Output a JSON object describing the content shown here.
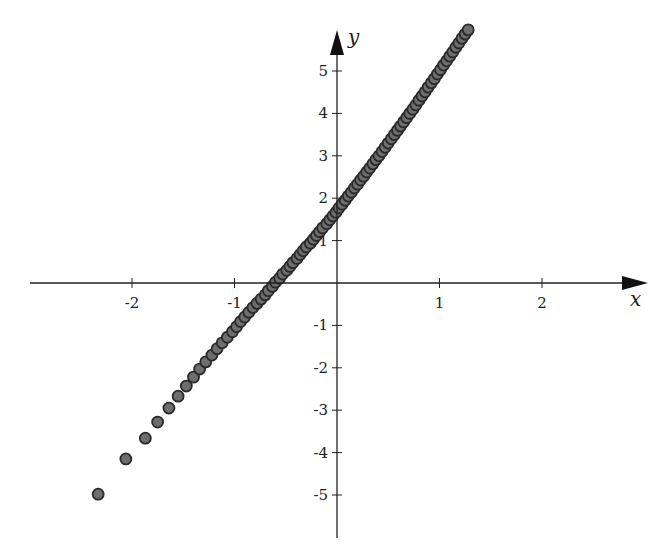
{
  "chart_data": {
    "type": "scatter",
    "title": "",
    "xlabel": "x",
    "ylabel": "y",
    "xlim": [
      -3.0,
      2.9
    ],
    "ylim": [
      -5.9,
      6.0
    ],
    "grid": false,
    "legend": null,
    "x_ticks": [
      -2,
      -1,
      1,
      2
    ],
    "x_tick_labels": [
      "-2",
      "-1",
      "1",
      "2"
    ],
    "y_ticks": [
      -5,
      -4,
      -3,
      -2,
      -1,
      1,
      2,
      3,
      4,
      5
    ],
    "y_tick_labels": [
      "-5",
      "-4",
      "-3",
      "-2",
      "-1",
      "1",
      "2",
      "3",
      "4",
      "5"
    ],
    "marker": {
      "shape": "circle",
      "fill": "#6e6e6e",
      "stroke": "#2a2a2a"
    },
    "series": [
      {
        "name": "points",
        "points": [
          [
            -2.33,
            -4.98
          ],
          [
            -2.06,
            -4.15
          ],
          [
            -1.87,
            -3.66
          ],
          [
            -1.75,
            -3.28
          ],
          [
            -1.64,
            -2.95
          ],
          [
            -1.55,
            -2.67
          ],
          [
            -1.47,
            -2.43
          ],
          [
            -1.4,
            -2.22
          ],
          [
            -1.34,
            -2.03
          ],
          [
            -1.28,
            -1.86
          ],
          [
            -1.22,
            -1.7
          ],
          [
            -1.17,
            -1.55
          ],
          [
            -1.12,
            -1.41
          ],
          [
            -1.07,
            -1.28
          ],
          [
            -1.02,
            -1.15
          ],
          [
            -0.98,
            -1.03
          ],
          [
            -0.94,
            -0.91
          ],
          [
            -0.9,
            -0.8
          ],
          [
            -0.86,
            -0.69
          ],
          [
            -0.82,
            -0.58
          ],
          [
            -0.78,
            -0.48
          ],
          [
            -0.74,
            -0.38
          ],
          [
            -0.7,
            -0.28
          ],
          [
            -0.67,
            -0.18
          ],
          [
            -0.63,
            -0.08
          ],
          [
            -0.6,
            0.02
          ],
          [
            -0.56,
            0.11
          ],
          [
            -0.53,
            0.21
          ],
          [
            -0.49,
            0.3
          ],
          [
            -0.46,
            0.39
          ],
          [
            -0.43,
            0.48
          ],
          [
            -0.39,
            0.58
          ],
          [
            -0.36,
            0.67
          ],
          [
            -0.33,
            0.76
          ],
          [
            -0.3,
            0.85
          ],
          [
            -0.26,
            0.94
          ],
          [
            -0.23,
            1.03
          ],
          [
            -0.2,
            1.12
          ],
          [
            -0.17,
            1.21
          ],
          [
            -0.14,
            1.3
          ],
          [
            -0.1,
            1.4
          ],
          [
            -0.07,
            1.49
          ],
          [
            -0.04,
            1.58
          ],
          [
            -0.01,
            1.67
          ],
          [
            0.02,
            1.77
          ],
          [
            0.05,
            1.86
          ],
          [
            0.08,
            1.95
          ],
          [
            0.11,
            2.05
          ],
          [
            0.14,
            2.14
          ],
          [
            0.17,
            2.24
          ],
          [
            0.2,
            2.33
          ],
          [
            0.23,
            2.43
          ],
          [
            0.26,
            2.52
          ],
          [
            0.29,
            2.62
          ],
          [
            0.32,
            2.71
          ],
          [
            0.35,
            2.81
          ],
          [
            0.38,
            2.91
          ],
          [
            0.41,
            3.0
          ],
          [
            0.44,
            3.1
          ],
          [
            0.47,
            3.2
          ],
          [
            0.5,
            3.3
          ],
          [
            0.53,
            3.4
          ],
          [
            0.56,
            3.5
          ],
          [
            0.59,
            3.6
          ],
          [
            0.62,
            3.7
          ],
          [
            0.65,
            3.8
          ],
          [
            0.68,
            3.9
          ],
          [
            0.71,
            4.0
          ],
          [
            0.74,
            4.1
          ],
          [
            0.77,
            4.2
          ],
          [
            0.8,
            4.31
          ],
          [
            0.83,
            4.41
          ],
          [
            0.86,
            4.51
          ],
          [
            0.89,
            4.62
          ],
          [
            0.92,
            4.72
          ],
          [
            0.95,
            4.82
          ],
          [
            0.98,
            4.93
          ],
          [
            1.01,
            5.03
          ],
          [
            1.04,
            5.14
          ],
          [
            1.07,
            5.24
          ],
          [
            1.1,
            5.35
          ],
          [
            1.13,
            5.45
          ],
          [
            1.16,
            5.56
          ],
          [
            1.19,
            5.66
          ],
          [
            1.22,
            5.77
          ],
          [
            1.25,
            5.87
          ],
          [
            1.28,
            5.97
          ]
        ]
      }
    ]
  }
}
